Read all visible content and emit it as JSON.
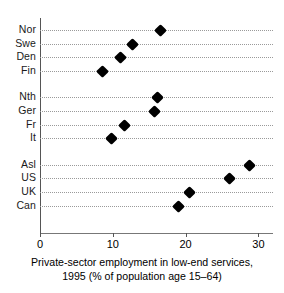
{
  "chart_data": {
    "type": "scatter",
    "orientation": "horizontal",
    "title": "",
    "xlabel": "Private-sector employment in low-end services, 1995 (% of population age 15–64)",
    "ylabel": "",
    "xlim": [
      0,
      32
    ],
    "xticks": [
      0,
      10,
      20,
      30
    ],
    "xtick_labels": [
      "0",
      "10",
      "20",
      "30"
    ],
    "grid": "dotted horizontal gridlines per category",
    "legend": "none",
    "marker_style": "filled black diamond",
    "categories": [
      "Nor",
      "Swe",
      "Den",
      "Fin",
      "Nth",
      "Ger",
      "Fr",
      "It",
      "Asl",
      "US",
      "UK",
      "Can"
    ],
    "values": [
      16.6,
      12.7,
      11.0,
      8.6,
      16.1,
      15.7,
      11.6,
      9.8,
      28.8,
      26.0,
      20.5,
      19.0
    ],
    "groups": [
      {
        "name": "Nordic",
        "categories": [
          "Nor",
          "Swe",
          "Den",
          "Fin"
        ]
      },
      {
        "name": "Continental",
        "categories": [
          "Nth",
          "Ger",
          "Fr",
          "It"
        ]
      },
      {
        "name": "Anglo",
        "categories": [
          "Asl",
          "US",
          "UK",
          "Can"
        ]
      }
    ],
    "points": [
      {
        "label": "Nor",
        "value": 16.6,
        "group": 0
      },
      {
        "label": "Swe",
        "value": 12.7,
        "group": 0
      },
      {
        "label": "Den",
        "value": 11.0,
        "group": 0
      },
      {
        "label": "Fin",
        "value": 8.6,
        "group": 0
      },
      {
        "label": "Nth",
        "value": 16.1,
        "group": 1
      },
      {
        "label": "Ger",
        "value": 15.7,
        "group": 1
      },
      {
        "label": "Fr",
        "value": 11.6,
        "group": 1
      },
      {
        "label": "It",
        "value": 9.8,
        "group": 1
      },
      {
        "label": "Asl",
        "value": 28.8,
        "group": 2
      },
      {
        "label": "US",
        "value": 26.0,
        "group": 2
      },
      {
        "label": "UK",
        "value": 20.5,
        "group": 2
      },
      {
        "label": "Can",
        "value": 19.0,
        "group": 2
      }
    ]
  },
  "caption": {
    "line1": "Private-sector employment in low-end services,",
    "line2": "1995 (% of population age 15–64)"
  },
  "colors": {
    "marker": "#000000",
    "axis": "#555555",
    "grid": "#9a9a9a",
    "background": "#ffffff",
    "text": "#000000"
  }
}
